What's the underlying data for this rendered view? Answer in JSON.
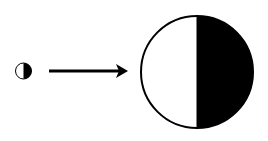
{
  "diagram": {
    "colors": {
      "stroke": "#000000",
      "fill_dark": "#000000",
      "fill_light": "#ffffff",
      "background": "#ffffff"
    },
    "small_circle": {
      "cx": 23.5,
      "cy": 71,
      "r": 8,
      "shaded_half": "right"
    },
    "arrow": {
      "x1": 49,
      "x2": 128,
      "y": 71,
      "direction": "right"
    },
    "large_circle": {
      "cx": 197,
      "cy": 72,
      "r": 56,
      "shaded_half": "right"
    }
  }
}
